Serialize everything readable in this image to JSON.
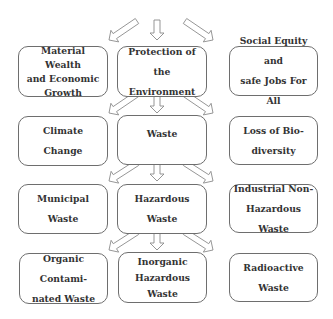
{
  "diagram": {
    "rows": [
      {
        "nodes": [
          {
            "id": "material-wealth",
            "label": "Material Wealth\nand Economic\nGrowth"
          },
          {
            "id": "protection-environment",
            "label": "Protection of the\nEnvironment"
          },
          {
            "id": "social-equity",
            "label": "Social Equity and\nsafe Jobs For All"
          }
        ]
      },
      {
        "nodes": [
          {
            "id": "climate-change",
            "label": "Climate\nChange"
          },
          {
            "id": "waste",
            "label": "Waste"
          },
          {
            "id": "loss-biodiversity",
            "label": "Loss of Bio-\ndiversity"
          }
        ]
      },
      {
        "nodes": [
          {
            "id": "municipal-waste",
            "label": "Municipal\nWaste"
          },
          {
            "id": "hazardous-waste",
            "label": "Hazardous\nWaste"
          },
          {
            "id": "industrial-non-hazardous",
            "label": "Industrial Non-\nHazardous Waste"
          }
        ]
      },
      {
        "nodes": [
          {
            "id": "organic-contaminated",
            "label": "Organic Contami-\nnated Waste"
          },
          {
            "id": "inorganic-hazardous",
            "label": "Inorganic\nHazardous\nWaste"
          },
          {
            "id": "radioactive-waste",
            "label": "Radioactive\nWaste"
          }
        ]
      }
    ],
    "edges": [
      {
        "from": "top",
        "to": "material-wealth"
      },
      {
        "from": "top",
        "to": "protection-environment"
      },
      {
        "from": "top",
        "to": "social-equity"
      },
      {
        "from": "protection-environment",
        "to": "climate-change"
      },
      {
        "from": "protection-environment",
        "to": "waste"
      },
      {
        "from": "protection-environment",
        "to": "loss-biodiversity"
      },
      {
        "from": "waste",
        "to": "municipal-waste"
      },
      {
        "from": "waste",
        "to": "hazardous-waste"
      },
      {
        "from": "waste",
        "to": "industrial-non-hazardous"
      },
      {
        "from": "hazardous-waste",
        "to": "organic-contaminated"
      },
      {
        "from": "hazardous-waste",
        "to": "inorganic-hazardous"
      },
      {
        "from": "hazardous-waste",
        "to": "radioactive-waste"
      }
    ],
    "colors": {
      "box_border": "#6e6e6e",
      "arrow_outline": "#8a8a8a",
      "text": "#333333",
      "background": "#ffffff"
    }
  }
}
